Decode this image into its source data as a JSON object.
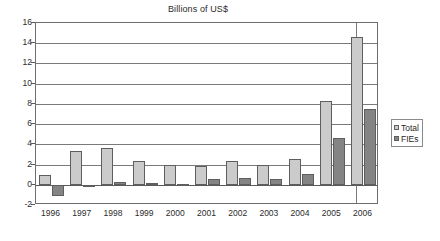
{
  "chart_data": {
    "type": "bar",
    "title": "Billions of US$",
    "xlabel": "",
    "ylabel": "",
    "ylim": [
      -2,
      16
    ],
    "ytick_step": 2,
    "yticks": [
      "16",
      "14",
      "12",
      "10",
      "8",
      "6",
      "4",
      "2",
      "0",
      "-2"
    ],
    "grid": true,
    "legend_position": "right",
    "categories": [
      "1996",
      "1997",
      "1998",
      "1999",
      "2000",
      "2001",
      "2002",
      "2003",
      "2004",
      "2005",
      "2006"
    ],
    "series": [
      {
        "name": "Total",
        "color": "#cbcbcb",
        "values": [
          1.0,
          3.35,
          3.65,
          2.35,
          1.95,
          1.9,
          2.4,
          2.0,
          2.55,
          8.3,
          14.65
        ]
      },
      {
        "name": "FIEs",
        "color": "#848484",
        "values": [
          -1.1,
          -0.1,
          0.3,
          0.2,
          0.12,
          0.55,
          0.7,
          0.6,
          1.1,
          4.6,
          7.45
        ]
      }
    ]
  },
  "legend": {
    "items": [
      {
        "label": "Total"
      },
      {
        "label": "FIEs"
      }
    ]
  }
}
